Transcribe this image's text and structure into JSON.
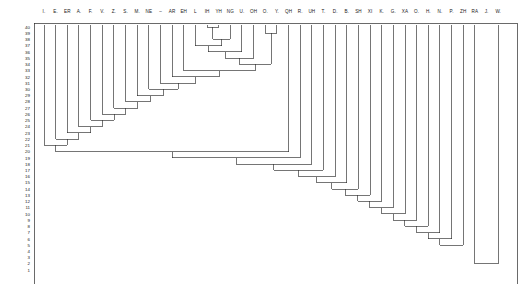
{
  "figure": {
    "title": "",
    "width": 520,
    "height": 288,
    "background": "#ffffff",
    "line_color": "#2b2b2b",
    "text_color": "#1a1a1a"
  },
  "chart_data": {
    "type": "tree",
    "subtype": "dendrogram",
    "orientation": "top-leaves",
    "title": "",
    "xlabel": "",
    "ylabel": "",
    "grid": false,
    "legend": false,
    "n_leaves": 41,
    "leaf_labels": [
      "I.",
      "E.",
      "ER",
      "A.",
      "F.",
      "V.",
      "Z.",
      "S.",
      "M.",
      "NE",
      "–",
      "AR",
      "EH",
      "L",
      "IH",
      "YH",
      "NG",
      "U.",
      "OH",
      "O.",
      "Y.",
      "QH",
      "R.",
      "UH",
      "T.",
      "D.",
      "B.",
      "SH",
      "XI",
      "K.",
      "G.",
      "XA",
      "O.",
      "H.",
      "N.",
      "P.",
      "ZH",
      "RA",
      "J.",
      "W.",
      ""
    ],
    "y_axis": {
      "label": "",
      "ticks": [
        40,
        39,
        38,
        37,
        36,
        35,
        34,
        33,
        32,
        31,
        30,
        29,
        28,
        27,
        26,
        25,
        24,
        23,
        22,
        21,
        20,
        19,
        18,
        17,
        16,
        15,
        14,
        13,
        12,
        11,
        10,
        9,
        8,
        7,
        6,
        5,
        4,
        3,
        2,
        1
      ],
      "range_top": 40,
      "range_bottom": 1,
      "direction": "descending"
    },
    "merges": [
      {
        "step": 40,
        "height": 40,
        "left_leaf": 14,
        "right_leaf": 15,
        "note": "IH + YH"
      },
      {
        "step": 39,
        "height": 39,
        "left_leaf": 19,
        "right_leaf": 20,
        "note": "O. + Y."
      },
      {
        "step": 38,
        "height": 38,
        "left_leaf": 16,
        "right": "cluster-40",
        "note": "NG joins IH/YH"
      },
      {
        "step": 37,
        "height": 37,
        "left_leaf": 13,
        "right": "cluster-38"
      },
      {
        "step": 36,
        "height": 36,
        "left": "cluster-37",
        "right_leaf": 17
      },
      {
        "step": 35,
        "height": 35,
        "left": "cluster-36",
        "right_leaf": 18
      },
      {
        "step": 34,
        "height": 34,
        "left": "cluster-35",
        "right": "cluster-39"
      },
      {
        "step": 33,
        "height": 33,
        "left_leaf": 12,
        "right": "cluster-34"
      },
      {
        "step": 32,
        "height": 32,
        "left_leaf": 11,
        "right": "cluster-33"
      },
      {
        "step": 31,
        "height": 31,
        "left_leaf": 10,
        "right": "cluster-32"
      },
      {
        "step": 30,
        "height": 30,
        "left_leaf": 9,
        "right": "cluster-31"
      },
      {
        "step": 29,
        "height": 29,
        "left_leaf": 8,
        "right": "cluster-30"
      },
      {
        "step": 28,
        "height": 28,
        "left_leaf": 7,
        "right": "cluster-29"
      },
      {
        "step": 27,
        "height": 27,
        "left_leaf": 6,
        "right": "cluster-28"
      },
      {
        "step": 26,
        "height": 26,
        "left_leaf": 5,
        "right": "cluster-27"
      },
      {
        "step": 25,
        "height": 25,
        "left_leaf": 4,
        "right": "cluster-26"
      },
      {
        "step": 24,
        "height": 24,
        "left_leaf": 3,
        "right": "cluster-25"
      },
      {
        "step": 23,
        "height": 23,
        "left_leaf": 2,
        "right": "cluster-24"
      },
      {
        "step": 22,
        "height": 22,
        "left_leaf": 1,
        "right": "cluster-23"
      },
      {
        "step": 21,
        "height": 21,
        "left_leaf": 0,
        "right": "cluster-22"
      },
      {
        "step": 20,
        "height": 20,
        "left": "cluster-21",
        "right_leaf": 21
      },
      {
        "step": 19,
        "height": 19,
        "left": "cluster-20",
        "right_leaf": 22
      },
      {
        "step": 18,
        "height": 18,
        "left": "cluster-19",
        "right_leaf": 23
      },
      {
        "step": 17,
        "height": 17,
        "left": "cluster-18",
        "right_leaf": 24
      },
      {
        "step": 16,
        "height": 16,
        "left": "cluster-17",
        "right_leaf": 25
      },
      {
        "step": 15,
        "height": 15,
        "left": "cluster-16",
        "right_leaf": 26
      },
      {
        "step": 14,
        "height": 14,
        "left": "cluster-15",
        "right_leaf": 27
      },
      {
        "step": 13,
        "height": 13,
        "left": "cluster-14",
        "right_leaf": 28
      },
      {
        "step": 12,
        "height": 12,
        "left": "cluster-13",
        "right_leaf": 29
      },
      {
        "step": 11,
        "height": 11,
        "left": "cluster-12",
        "right_leaf": 30
      },
      {
        "step": 10,
        "height": 10,
        "left": "cluster-11",
        "right_leaf": 31
      },
      {
        "step": 9,
        "height": 9,
        "left": "cluster-10",
        "right_leaf": 32
      },
      {
        "step": 8,
        "height": 8,
        "left": "cluster-9",
        "right_leaf": 33
      },
      {
        "step": 7,
        "height": 7,
        "left": "cluster-8",
        "right_leaf": 34
      },
      {
        "step": 6,
        "height": 6,
        "left": "cluster-7",
        "right_leaf": 35
      },
      {
        "step": 5,
        "height": 5,
        "left": "cluster-6",
        "right_leaf": 36
      },
      {
        "step": 4,
        "height": 4,
        "left": "cluster-5",
        "right": "cluster-2"
      },
      {
        "step": 3,
        "height": 3,
        "left": "cluster-4",
        "right_leaf": 38
      },
      {
        "step": 2,
        "height": 2,
        "left_leaf": 37,
        "right": "merge-top-right"
      },
      {
        "step": 1,
        "height": 1,
        "left": "cluster-3",
        "right_leaf": 39
      }
    ],
    "leaf_x_positions": [
      57,
      70,
      83,
      96,
      109,
      121,
      134,
      147,
      160,
      173,
      185,
      198,
      211,
      224,
      236,
      249,
      262,
      275,
      288,
      300,
      313,
      326,
      339,
      351,
      364,
      377,
      390,
      403,
      415,
      428,
      441,
      454,
      466,
      479,
      492,
      505,
      518,
      531,
      544,
      556,
      569
    ]
  }
}
